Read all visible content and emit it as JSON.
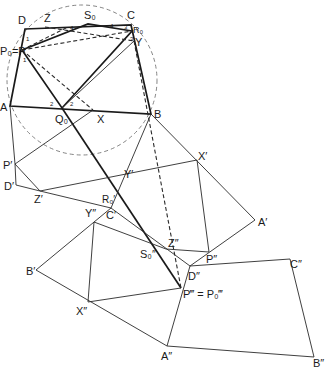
{
  "figure": {
    "circle": {
      "cx": 82,
      "cy": 80,
      "r": 75
    },
    "points": {
      "D": [
        25,
        29
      ],
      "C": [
        131,
        25
      ],
      "S0": [
        88,
        24
      ],
      "Z": [
        45,
        27
      ],
      "P": [
        22,
        50
      ],
      "R0": [
        132,
        31
      ],
      "Y": [
        134,
        41
      ],
      "A": [
        10,
        106
      ],
      "B": [
        151,
        114
      ],
      "Q0": [
        62,
        108
      ],
      "X": [
        93,
        110
      ],
      "P1": [
        15,
        164
      ],
      "D1": [
        16,
        185
      ],
      "Z1": [
        40,
        191
      ],
      "Y1": [
        122,
        182
      ],
      "X1": [
        197,
        160
      ],
      "R01": [
        108,
        205
      ],
      "C1": [
        111,
        208
      ],
      "A1": [
        255,
        220
      ],
      "Y2": [
        94,
        222
      ],
      "B1": [
        36,
        270
      ],
      "Z2": [
        166,
        249
      ],
      "S02": [
        148,
        243
      ],
      "P2": [
        209,
        252
      ],
      "D2": [
        190,
        266
      ],
      "C2": [
        290,
        259
      ],
      "P3": [
        181,
        288
      ],
      "X2": [
        88,
        302
      ],
      "A2": [
        167,
        346
      ],
      "B2": [
        314,
        357
      ]
    },
    "labels": {
      "D": "D",
      "C": "C",
      "S0": "S₀",
      "Z": "Z",
      "P": "P₀=P",
      "R0": "R₀",
      "Y": "Y",
      "A": "A",
      "B": "B",
      "Q0": "Q₀",
      "X": "X",
      "P1": "P′",
      "D1": "D′",
      "Z1": "Z′",
      "Y1": "Y′",
      "X1": "X′",
      "R01": "R₀′",
      "C1": "C′",
      "A1": "A′",
      "Y2": "Y″",
      "B1": "B′",
      "Z2": "Z″",
      "S02": "S₀″",
      "P2": "P″",
      "D2": "D″",
      "C2": "C″",
      "P3": "P‴ = P₀‴",
      "X2": "X″",
      "A2": "A″",
      "B2": "B″"
    },
    "angle_marks": [
      "1",
      "1",
      "2",
      "2",
      "3",
      "3",
      "4",
      "4"
    ]
  }
}
